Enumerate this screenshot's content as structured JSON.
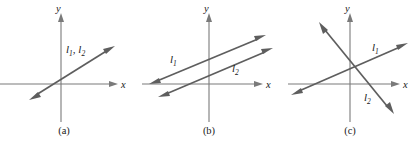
{
  "figure": {
    "width": 420,
    "height": 141,
    "background": "#ffffff",
    "line_color": "#5e5e5e",
    "axis_color": "#7a7a7a",
    "text_color": "#1a1a1a"
  },
  "panels": [
    {
      "id": "a",
      "caption": "(a)",
      "caption_x": 64,
      "caption_y": 133,
      "origin": {
        "x": 61,
        "y": 84
      },
      "x_axis": {
        "x1": 0,
        "x2": 112,
        "label": "x",
        "label_x": 120,
        "label_y": 88
      },
      "y_axis": {
        "y1": 122,
        "y2": 16,
        "label": "y",
        "label_x": 57,
        "label_y": 12
      },
      "lines": [
        {
          "name": "l1-l2-coincident",
          "label": "l",
          "sub": "1, 2",
          "label_x": 66,
          "label_y": 53,
          "x1": 31,
          "y1": 98,
          "x2": 112,
          "y2": 47,
          "arrow_start": true,
          "arrow_end": true
        }
      ],
      "labels": [
        {
          "name": "line-label-l1-l2",
          "text": "l",
          "sub": "1",
          "text2": ", l",
          "sub2": "2",
          "x": 66,
          "y": 53
        }
      ]
    },
    {
      "id": "b",
      "caption": "(b)",
      "caption_x": 209,
      "caption_y": 133,
      "origin": {
        "x": 209,
        "y": 84
      },
      "x_axis": {
        "x1": 142,
        "x2": 258,
        "label": "x",
        "label_x": 265,
        "label_y": 88
      },
      "y_axis": {
        "y1": 122,
        "y2": 16,
        "label": "y",
        "label_x": 205,
        "label_y": 12
      },
      "lines": [
        {
          "name": "l1-parallel",
          "x1": 151,
          "y1": 84,
          "x2": 263,
          "y2": 37,
          "arrow_start": true,
          "arrow_end": true
        },
        {
          "name": "l2-parallel",
          "x1": 159,
          "y1": 97,
          "x2": 270,
          "y2": 50,
          "arrow_start": true,
          "arrow_end": true
        }
      ],
      "labels": [
        {
          "name": "line-label-l1",
          "text": "l",
          "sub": "1",
          "x": 172,
          "y": 63
        },
        {
          "name": "line-label-l2",
          "text": "l",
          "sub": "2",
          "x": 234,
          "y": 72
        }
      ]
    },
    {
      "id": "c",
      "caption": "(c)",
      "caption_x": 350,
      "caption_y": 133,
      "origin": {
        "x": 350,
        "y": 84
      },
      "x_axis": {
        "x1": 288,
        "x2": 396,
        "label": "x",
        "label_x": 403,
        "label_y": 88
      },
      "y_axis": {
        "y1": 122,
        "y2": 16,
        "label": "y",
        "label_x": 346,
        "label_y": 12
      },
      "lines": [
        {
          "name": "l1-increasing",
          "x1": 293,
          "y1": 93,
          "x2": 404,
          "y2": 44,
          "arrow_start": true,
          "arrow_end": true
        },
        {
          "name": "l2-decreasing",
          "x1": 320,
          "y1": 23,
          "x2": 392,
          "y2": 113,
          "arrow_start": true,
          "arrow_end": true
        }
      ],
      "labels": [
        {
          "name": "line-label-l1",
          "text": "l",
          "sub": "1",
          "x": 374,
          "y": 51
        },
        {
          "name": "line-label-l2",
          "text": "l",
          "sub": "2",
          "x": 366,
          "y": 100
        }
      ]
    }
  ]
}
